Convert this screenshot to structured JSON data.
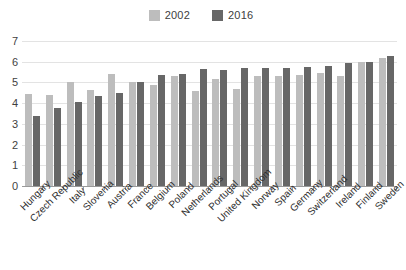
{
  "chart_data": {
    "type": "bar",
    "title": "",
    "subtitle": "",
    "xlabel": "",
    "ylabel": "",
    "ylim": [
      0,
      7
    ],
    "ytick_labels": [
      "7",
      "6",
      "5",
      "4",
      "3",
      "2",
      "1",
      "0"
    ],
    "ytick_values": [
      7,
      6,
      5,
      4,
      3,
      2,
      1,
      0
    ],
    "grid": true,
    "legend_position": "top-center",
    "categories": [
      "Hungary",
      "Czech Republic",
      "Italy",
      "Slovenia",
      "Austria",
      "France",
      "Belgium",
      "Poland",
      "Netherlands",
      "Portugal",
      "United Kingdom",
      "Norway",
      "Spain",
      "Germany",
      "Switzerland",
      "Ireland",
      "Finland",
      "Sweden"
    ],
    "series": [
      {
        "name": "2002",
        "color": "#bdbdbd",
        "values": [
          4.45,
          4.4,
          5.0,
          4.65,
          5.4,
          5.0,
          4.9,
          5.3,
          4.6,
          5.15,
          4.7,
          5.3,
          5.3,
          5.35,
          5.45,
          5.3,
          6.0,
          6.2
        ]
      },
      {
        "name": "2016",
        "color": "#676767",
        "values": [
          3.4,
          3.75,
          4.05,
          4.35,
          4.5,
          5.0,
          5.35,
          5.4,
          5.65,
          5.6,
          5.7,
          5.7,
          5.7,
          5.75,
          5.8,
          5.95,
          6.0,
          6.3
        ]
      }
    ]
  }
}
